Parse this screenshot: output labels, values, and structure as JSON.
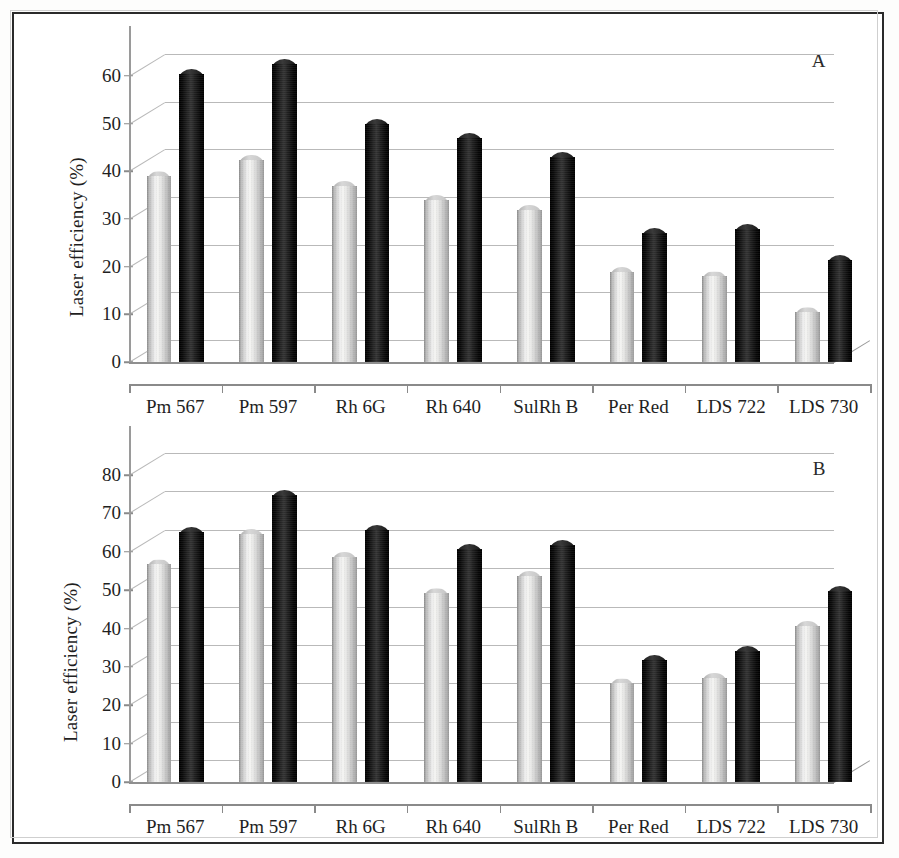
{
  "figure": {
    "background_color": "#ffffff",
    "border_color": "#2a2a2a",
    "light_bar_color": "#ededed",
    "dark_bar_color": "#111111",
    "gridline_color": "#b9b9b9"
  },
  "panels": [
    {
      "letter": "A",
      "ylabel": "Laser efficiency (%)",
      "ytick_labels": [
        "0",
        "10",
        "20",
        "30",
        "40",
        "50",
        "60"
      ],
      "xtick_labels": [
        "Pm 567",
        "Pm 597",
        "Rh 6G",
        "Rh 640",
        "SulRh B",
        "Per Red",
        "LDS 722",
        "LDS 730"
      ]
    },
    {
      "letter": "B",
      "ylabel": "Laser efficiency (%)",
      "ytick_labels": [
        "0",
        "10",
        "20",
        "30",
        "40",
        "50",
        "60",
        "70",
        "80"
      ],
      "xtick_labels": [
        "Pm 567",
        "Pm 597",
        "Rh 6G",
        "Rh 640",
        "SulRh B",
        "Per Red",
        "LDS 722",
        "LDS 730"
      ]
    }
  ],
  "chart_data": [
    {
      "type": "bar",
      "panel": "A",
      "title": "",
      "xlabel": "",
      "ylabel": "Laser efficiency (%)",
      "ylim": [
        0,
        65
      ],
      "yticks": [
        0,
        10,
        20,
        30,
        40,
        50,
        60
      ],
      "grid": true,
      "legend": "none",
      "categories": [
        "Pm 567",
        "Pm 597",
        "Rh 6G",
        "Rh 640",
        "SulRh B",
        "Per Red",
        "LDS 722",
        "LDS 730"
      ],
      "series": [
        {
          "name": "light",
          "color": "#ededed",
          "values": [
            40,
            43.5,
            38,
            35,
            33,
            20,
            19,
            11.5
          ]
        },
        {
          "name": "dark",
          "color": "#111111",
          "values": [
            61.5,
            63.5,
            51,
            48,
            44,
            28,
            29,
            22.5
          ]
        }
      ]
    },
    {
      "type": "bar",
      "panel": "B",
      "title": "",
      "xlabel": "",
      "ylabel": "Laser efficiency (%)",
      "ylim": [
        0,
        86
      ],
      "yticks": [
        0,
        10,
        20,
        30,
        40,
        50,
        60,
        70,
        80
      ],
      "grid": true,
      "legend": "none",
      "categories": [
        "Pm 567",
        "Pm 597",
        "Rh 6G",
        "Rh 640",
        "SulRh B",
        "Per Red",
        "LDS 722",
        "LDS 730"
      ],
      "series": [
        {
          "name": "light",
          "color": "#ededed",
          "values": [
            58,
            66,
            60,
            50.5,
            55,
            27,
            28.5,
            42
          ]
        },
        {
          "name": "dark",
          "color": "#111111",
          "values": [
            66.5,
            76,
            67,
            62,
            63,
            33,
            35.5,
            51
          ]
        }
      ]
    }
  ]
}
